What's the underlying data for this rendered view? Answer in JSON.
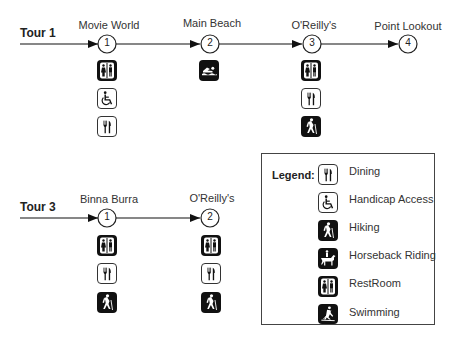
{
  "tours": [
    {
      "label": "Tour 1",
      "stops": [
        {
          "number": "1",
          "name": "Movie World",
          "amenities": [
            "restroom",
            "handicap",
            "dining"
          ]
        },
        {
          "number": "2",
          "name": "Main Beach",
          "amenities": [
            "swimming"
          ]
        },
        {
          "number": "3",
          "name": "O'Reilly's",
          "amenities": [
            "restroom",
            "dining",
            "hiking"
          ]
        },
        {
          "number": "4",
          "name": "Point Lookout",
          "amenities": []
        }
      ]
    },
    {
      "label": "Tour 3",
      "stops": [
        {
          "number": "1",
          "name": "Binna Burra",
          "amenities": [
            "restroom",
            "dining",
            "hiking"
          ]
        },
        {
          "number": "2",
          "name": "O'Reilly's",
          "amenities": [
            "restroom",
            "dining",
            "hiking"
          ]
        }
      ]
    }
  ],
  "legend": {
    "title": "Legend:",
    "items": [
      {
        "key": "dining",
        "label": "Dining",
        "icon": "dining-icon"
      },
      {
        "key": "handicap",
        "label": "Handicap Access",
        "icon": "wheelchair-icon"
      },
      {
        "key": "hiking",
        "label": "Hiking",
        "icon": "hiker-icon"
      },
      {
        "key": "horse",
        "label": "Horseback Riding",
        "icon": "horse-rider-icon"
      },
      {
        "key": "restroom",
        "label": "RestRoom",
        "icon": "restroom-icon"
      },
      {
        "key": "swimming",
        "label": "Swimming",
        "icon": "swimmer-icon"
      }
    ]
  }
}
